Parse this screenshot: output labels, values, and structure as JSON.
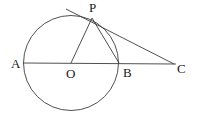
{
  "figure": {
    "type": "geometry-diagram",
    "width": 199,
    "height": 116,
    "background_color": "#ffffff",
    "stroke_color": "#3c3c3c",
    "label_color": "#1a1a1a"
  },
  "points": [
    {
      "id": "A",
      "label": "A",
      "x": 23,
      "y": 63,
      "label_x": 11,
      "label_y": 57
    },
    {
      "id": "O",
      "label": "O",
      "x": 71,
      "y": 63,
      "label_x": 66,
      "label_y": 67
    },
    {
      "id": "B",
      "label": "B",
      "x": 119,
      "y": 63,
      "label_x": 123,
      "label_y": 66
    },
    {
      "id": "C",
      "label": "C",
      "x": 173,
      "y": 64,
      "label_x": 177,
      "label_y": 62
    },
    {
      "id": "P",
      "label": "P",
      "x": 92,
      "y": 17,
      "label_x": 89,
      "label_y": 1
    }
  ],
  "circle": {
    "center_x": 71,
    "center_y": 63,
    "radius": 47.5
  },
  "segments": [
    {
      "name": "line-AC",
      "x1": 23,
      "y1": 63,
      "x2": 176,
      "y2": 64
    },
    {
      "name": "segment-OP",
      "x1": 71,
      "y1": 63,
      "x2": 92,
      "y2": 18
    },
    {
      "name": "segment-PB",
      "x1": 92,
      "y1": 18,
      "x2": 119,
      "y2": 63
    },
    {
      "name": "tangent-line",
      "x1": 66,
      "y1": 9,
      "x2": 174,
      "y2": 64
    }
  ]
}
